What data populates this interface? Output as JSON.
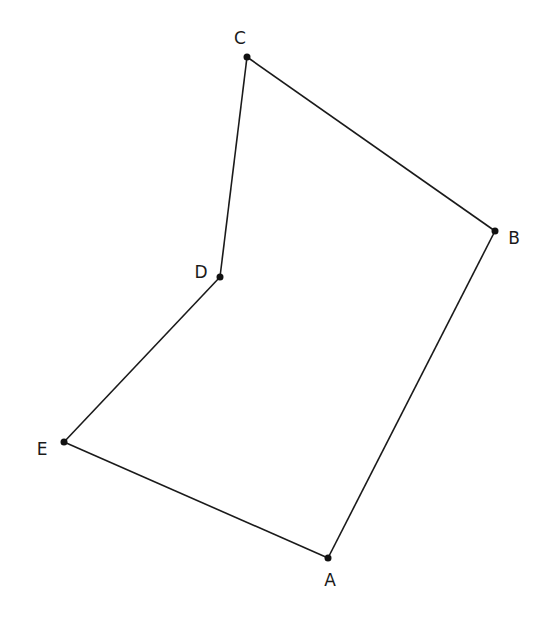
{
  "diagram": {
    "type": "polygon",
    "stroke_color": "#1a1a1a",
    "point_color": "#111111",
    "points": [
      {
        "id": "A",
        "label": "A",
        "x": 328,
        "y": 558,
        "lx": 330,
        "ly": 586
      },
      {
        "id": "B",
        "label": "B",
        "x": 495,
        "y": 231,
        "lx": 514,
        "ly": 244
      },
      {
        "id": "C",
        "label": "C",
        "x": 247,
        "y": 57,
        "lx": 240,
        "ly": 44
      },
      {
        "id": "D",
        "label": "D",
        "x": 220,
        "y": 277,
        "lx": 201,
        "ly": 278
      },
      {
        "id": "E",
        "label": "E",
        "x": 64,
        "y": 442,
        "lx": 42,
        "ly": 455
      }
    ],
    "edges": [
      [
        "A",
        "B"
      ],
      [
        "B",
        "C"
      ],
      [
        "C",
        "D"
      ],
      [
        "D",
        "E"
      ],
      [
        "E",
        "A"
      ]
    ]
  }
}
